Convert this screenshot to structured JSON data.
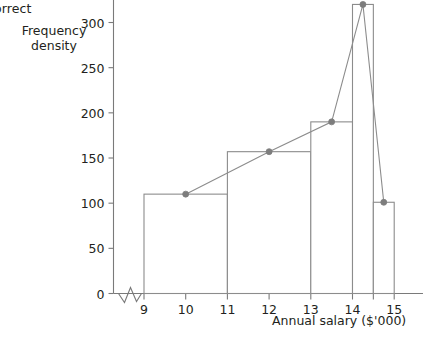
{
  "annotation": {
    "corner_note": "orrect"
  },
  "chart_data": {
    "type": "bar",
    "title": "",
    "xlabel": "Annual salary ($'000)",
    "ylabel": "Frequency density",
    "ylabel_lines": [
      "Frequency",
      "density"
    ],
    "xlim": [
      8.6,
      15.45
    ],
    "ylim": [
      0,
      330
    ],
    "grid": false,
    "legend": null,
    "axis_break_x": true,
    "y_ticks": [
      0,
      50,
      100,
      150,
      200,
      250,
      300
    ],
    "y_tick_labels": [
      "0",
      "50",
      "100",
      "150",
      "200",
      "250",
      "300"
    ],
    "x_ticks": [
      9,
      10,
      11,
      12,
      13,
      14,
      14.5,
      15
    ],
    "x_tick_labels": [
      "9",
      "10",
      "11",
      "12",
      "13",
      "14",
      "",
      "15"
    ],
    "bins": [
      {
        "start": 9,
        "end": 11,
        "height": 110,
        "midpoint": 10,
        "label": "9-11"
      },
      {
        "start": 11,
        "end": 13,
        "height": 157,
        "midpoint": 12,
        "label": "11-13"
      },
      {
        "start": 13,
        "end": 14,
        "height": 190,
        "midpoint": 13.5,
        "label": "13-14"
      },
      {
        "start": 14,
        "end": 14.5,
        "height": 320,
        "midpoint": 14.25,
        "label": "14-14.5"
      },
      {
        "start": 14.5,
        "end": 15,
        "height": 101,
        "midpoint": 14.75,
        "label": "14.5-15"
      }
    ],
    "frequency_polygon": {
      "name": "Frequency polygon",
      "x": [
        10,
        12,
        13.5,
        14.25,
        14.75
      ],
      "y": [
        110,
        157,
        190,
        320,
        101
      ],
      "marker": "circle"
    },
    "colors": {
      "axis": "#7a7a7a",
      "bar_stroke": "#8c8c8c",
      "bar_fill": "#ffffff",
      "line": "#8c8c8c",
      "marker": "#7d7d7d",
      "text": "#231f20"
    }
  }
}
